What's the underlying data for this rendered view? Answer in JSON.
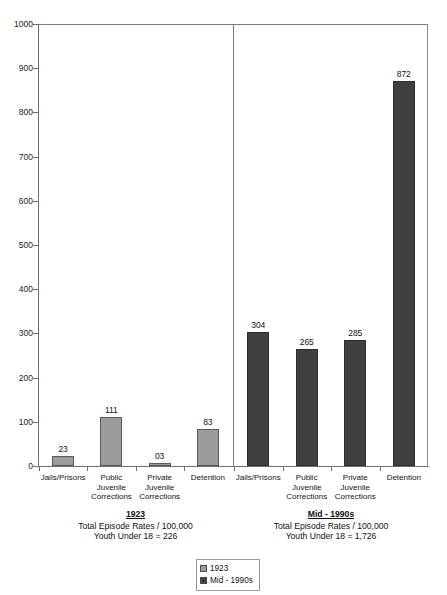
{
  "chart_data": {
    "type": "bar",
    "title": "",
    "xlabel": "",
    "ylabel": "",
    "ylim": [
      0,
      1000
    ],
    "ytick_labels": [
      "1000",
      "900",
      "800",
      "700",
      "600",
      "500",
      "400",
      "300",
      "200",
      "100",
      "0"
    ],
    "ytick_values": [
      1000,
      900,
      800,
      700,
      600,
      500,
      400,
      300,
      200,
      100,
      0
    ],
    "grid": false,
    "legend_position": "bottom-center",
    "categories": [
      "Jails/Prisons",
      "Public\nJuvenile\nCorrections",
      "Private\nJuvenile\nCorrections",
      "Detention"
    ],
    "series": [
      {
        "name": "1923",
        "color": "#9c9c9c",
        "values": [
          23,
          111,
          3,
          83
        ],
        "value_labels": [
          "23",
          "111",
          "03",
          "83"
        ]
      },
      {
        "name": "Mid - 1990s",
        "color": "#404040",
        "values": [
          304,
          265,
          285,
          872
        ],
        "value_labels": [
          "304",
          "265",
          "285",
          "872"
        ]
      }
    ],
    "panels": [
      {
        "series_name": "1923",
        "caption_title": "1923",
        "caption_line1": "Total Episode Rates / 100,000",
        "caption_line2": "Youth Under 18 = 226"
      },
      {
        "series_name": "Mid - 1990s",
        "caption_title": "Mid - 1990s",
        "caption_line1": "Total Episode Rates / 100,000",
        "caption_line2": "Youth Under 18 = 1,726"
      }
    ],
    "legend": [
      {
        "label": "1923",
        "color": "#9c9c9c"
      },
      {
        "label": "Mid - 1990s",
        "color": "#404040"
      }
    ]
  }
}
